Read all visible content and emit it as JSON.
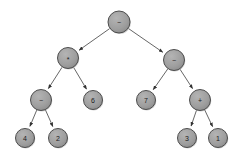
{
  "diagram": {
    "type": "binary-expression-tree",
    "title": "",
    "background_color": "#ffffff",
    "node_fill_color": "#9e9e9e",
    "node_stroke_color": "#4d4d4d",
    "edge_color": "#555555",
    "label_color": "#1a1a1a",
    "node_radius": 10.5,
    "leaf_radius": 9.5,
    "nodes": [
      {
        "id": "n0",
        "label": "−",
        "name": "node-root-minus",
        "kind": "operator",
        "cx": 119,
        "cy": 22,
        "r": 11
      },
      {
        "id": "n1",
        "label": "*",
        "name": "node-multiply",
        "kind": "operator",
        "cx": 68,
        "cy": 58,
        "r": 10.5
      },
      {
        "id": "n2",
        "label": "−",
        "name": "node-minus-right",
        "kind": "operator",
        "cx": 174,
        "cy": 60,
        "r": 10.5
      },
      {
        "id": "n3",
        "label": "−",
        "name": "node-minus-left",
        "kind": "operator",
        "cx": 41,
        "cy": 100,
        "r": 10.5
      },
      {
        "id": "n4",
        "label": "6",
        "name": "node-leaf-6",
        "kind": "number",
        "cx": 93,
        "cy": 100,
        "r": 9.5
      },
      {
        "id": "n5",
        "label": "7",
        "name": "node-leaf-7",
        "kind": "number",
        "cx": 146,
        "cy": 100,
        "r": 9.5
      },
      {
        "id": "n6",
        "label": "+",
        "name": "node-plus",
        "kind": "operator",
        "cx": 200,
        "cy": 100,
        "r": 10.5
      },
      {
        "id": "n7",
        "label": "4",
        "name": "node-leaf-4",
        "kind": "number",
        "cx": 25,
        "cy": 138,
        "r": 9.5
      },
      {
        "id": "n8",
        "label": "2",
        "name": "node-leaf-2",
        "kind": "number",
        "cx": 58,
        "cy": 138,
        "r": 9.5
      },
      {
        "id": "n9",
        "label": "3",
        "name": "node-leaf-3",
        "kind": "number",
        "cx": 187,
        "cy": 138,
        "r": 9.5
      },
      {
        "id": "n10",
        "label": "1",
        "name": "node-leaf-1",
        "kind": "number",
        "cx": 218,
        "cy": 138,
        "r": 9.5
      }
    ],
    "edges": [
      {
        "from": "n0",
        "to": "n1",
        "name": "edge-root-to-multiply"
      },
      {
        "from": "n0",
        "to": "n2",
        "name": "edge-root-to-minus-right"
      },
      {
        "from": "n1",
        "to": "n3",
        "name": "edge-multiply-to-minus-left"
      },
      {
        "from": "n1",
        "to": "n4",
        "name": "edge-multiply-to-6"
      },
      {
        "from": "n2",
        "to": "n5",
        "name": "edge-minus-right-to-7"
      },
      {
        "from": "n2",
        "to": "n6",
        "name": "edge-minus-right-to-plus"
      },
      {
        "from": "n3",
        "to": "n7",
        "name": "edge-minus-left-to-4"
      },
      {
        "from": "n3",
        "to": "n8",
        "name": "edge-minus-left-to-2"
      },
      {
        "from": "n6",
        "to": "n9",
        "name": "edge-plus-to-3"
      },
      {
        "from": "n6",
        "to": "n10",
        "name": "edge-plus-to-1"
      }
    ]
  }
}
